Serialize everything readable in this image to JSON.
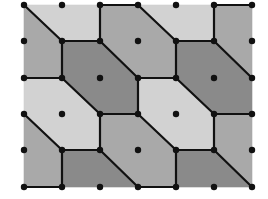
{
  "diagram": {
    "title": "Tiling of a lattice by hexagons and quadrilaterals",
    "grid": {
      "x": [
        24,
        62,
        100,
        138,
        176,
        214,
        252
      ],
      "y": [
        5,
        41,
        78,
        114,
        150,
        187
      ]
    },
    "colors": {
      "light": "#d2d2d2",
      "medium": "#a9a9a9",
      "dark": "#8a8a8a",
      "edge": "#111111",
      "dot": "#111111",
      "background": "#ffffff"
    },
    "regions": [
      {
        "name": "region-top-left-light",
        "shade": "light",
        "points": [
          [
            0,
            0
          ],
          [
            2,
            0
          ],
          [
            2,
            1
          ],
          [
            1,
            1
          ]
        ]
      },
      {
        "name": "region-top-left-medium",
        "shade": "medium",
        "points": [
          [
            0,
            0
          ],
          [
            1,
            1
          ],
          [
            1,
            2
          ],
          [
            0,
            2
          ]
        ]
      },
      {
        "name": "region-hexagon-dark-a",
        "shade": "dark",
        "points": [
          [
            1,
            1
          ],
          [
            2,
            1
          ],
          [
            3,
            2
          ],
          [
            3,
            3
          ],
          [
            2,
            3
          ],
          [
            1,
            2
          ]
        ]
      },
      {
        "name": "region-hexagon-medium-top",
        "shade": "medium",
        "points": [
          [
            2,
            0
          ],
          [
            3,
            0
          ],
          [
            4,
            1
          ],
          [
            4,
            2
          ],
          [
            3,
            2
          ],
          [
            2,
            1
          ]
        ]
      },
      {
        "name": "region-top-right-light",
        "shade": "light",
        "points": [
          [
            3,
            0
          ],
          [
            5,
            0
          ],
          [
            5,
            1
          ],
          [
            4,
            1
          ]
        ]
      },
      {
        "name": "region-top-right-medium",
        "shade": "medium",
        "points": [
          [
            5,
            0
          ],
          [
            6,
            0
          ],
          [
            6,
            2
          ],
          [
            5,
            1
          ]
        ]
      },
      {
        "name": "region-hexagon-dark-b",
        "shade": "dark",
        "points": [
          [
            4,
            1
          ],
          [
            5,
            1
          ],
          [
            6,
            2
          ],
          [
            6,
            3
          ],
          [
            5,
            3
          ],
          [
            4,
            2
          ]
        ]
      },
      {
        "name": "region-hexagon-light-c",
        "shade": "light",
        "points": [
          [
            0,
            2
          ],
          [
            1,
            2
          ],
          [
            2,
            3
          ],
          [
            2,
            4
          ],
          [
            1,
            4
          ],
          [
            0,
            3
          ]
        ]
      },
      {
        "name": "region-hexagon-light-d",
        "shade": "light",
        "points": [
          [
            3,
            2
          ],
          [
            4,
            2
          ],
          [
            5,
            3
          ],
          [
            5,
            4
          ],
          [
            4,
            4
          ],
          [
            3,
            3
          ]
        ]
      },
      {
        "name": "region-hexagon-medium-mid",
        "shade": "medium",
        "points": [
          [
            2,
            3
          ],
          [
            3,
            3
          ],
          [
            4,
            4
          ],
          [
            4,
            5
          ],
          [
            3,
            5
          ],
          [
            2,
            4
          ]
        ]
      },
      {
        "name": "region-bottom-left-medium",
        "shade": "medium",
        "points": [
          [
            0,
            3
          ],
          [
            1,
            4
          ],
          [
            1,
            5
          ],
          [
            0,
            5
          ]
        ]
      },
      {
        "name": "region-bottom-left-dark",
        "shade": "dark",
        "points": [
          [
            1,
            4
          ],
          [
            2,
            4
          ],
          [
            3,
            5
          ],
          [
            1,
            5
          ]
        ]
      },
      {
        "name": "region-right-medium",
        "shade": "medium",
        "points": [
          [
            5,
            3
          ],
          [
            6,
            3
          ],
          [
            6,
            5
          ],
          [
            5,
            4
          ]
        ]
      },
      {
        "name": "region-bottom-right-dark",
        "shade": "dark",
        "points": [
          [
            4,
            4
          ],
          [
            5,
            4
          ],
          [
            6,
            5
          ],
          [
            4,
            5
          ]
        ]
      }
    ],
    "edges": [
      [
        [
          0,
          0
        ],
        [
          1,
          1
        ]
      ],
      [
        [
          1,
          1
        ],
        [
          2,
          1
        ]
      ],
      [
        [
          2,
          1
        ],
        [
          2,
          0
        ]
      ],
      [
        [
          2,
          0
        ],
        [
          3,
          0
        ]
      ],
      [
        [
          3,
          0
        ],
        [
          4,
          1
        ]
      ],
      [
        [
          4,
          1
        ],
        [
          5,
          1
        ]
      ],
      [
        [
          5,
          1
        ],
        [
          5,
          0
        ]
      ],
      [
        [
          5,
          0
        ],
        [
          6,
          0
        ]
      ],
      [
        [
          1,
          1
        ],
        [
          1,
          2
        ]
      ],
      [
        [
          2,
          1
        ],
        [
          3,
          2
        ]
      ],
      [
        [
          4,
          1
        ],
        [
          4,
          2
        ]
      ],
      [
        [
          5,
          1
        ],
        [
          6,
          2
        ]
      ],
      [
        [
          0,
          2
        ],
        [
          1,
          2
        ]
      ],
      [
        [
          3,
          2
        ],
        [
          4,
          2
        ]
      ],
      [
        [
          1,
          2
        ],
        [
          2,
          3
        ]
      ],
      [
        [
          3,
          2
        ],
        [
          3,
          3
        ]
      ],
      [
        [
          4,
          2
        ],
        [
          5,
          3
        ]
      ],
      [
        [
          2,
          3
        ],
        [
          3,
          3
        ]
      ],
      [
        [
          5,
          3
        ],
        [
          6,
          3
        ]
      ],
      [
        [
          0,
          3
        ],
        [
          1,
          4
        ]
      ],
      [
        [
          2,
          3
        ],
        [
          2,
          4
        ]
      ],
      [
        [
          3,
          3
        ],
        [
          4,
          4
        ]
      ],
      [
        [
          5,
          3
        ],
        [
          5,
          4
        ]
      ],
      [
        [
          1,
          4
        ],
        [
          2,
          4
        ]
      ],
      [
        [
          4,
          4
        ],
        [
          5,
          4
        ]
      ],
      [
        [
          1,
          4
        ],
        [
          1,
          5
        ]
      ],
      [
        [
          2,
          4
        ],
        [
          3,
          5
        ]
      ],
      [
        [
          4,
          4
        ],
        [
          4,
          5
        ]
      ],
      [
        [
          5,
          4
        ],
        [
          6,
          5
        ]
      ],
      [
        [
          0,
          5
        ],
        [
          1,
          5
        ]
      ],
      [
        [
          3,
          5
        ],
        [
          4,
          5
        ]
      ]
    ],
    "dot_radius": 3.2,
    "edge_width": 2.2
  }
}
